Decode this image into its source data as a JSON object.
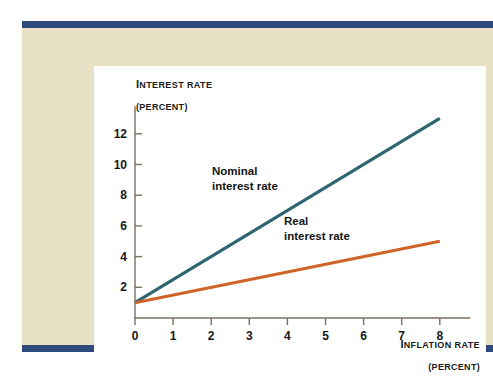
{
  "figure": {
    "background_color": "#ffffff",
    "panel_color": "#e9e1c5",
    "card_color": "#ffffff",
    "rule_color": "#2e4a7d"
  },
  "chart_data": {
    "type": "line",
    "title": "",
    "subtitle": "",
    "xlabel": "INFLATION RATE",
    "xunit": "(PERCENT)",
    "ylabel": "INTEREST RATE",
    "yunit": "(PERCENT)",
    "xlim": [
      0,
      8.8
    ],
    "ylim": [
      0,
      13.8
    ],
    "xticks": [
      0,
      1,
      2,
      3,
      4,
      5,
      6,
      7,
      8
    ],
    "xtick_labels": [
      "0",
      "1",
      "2",
      "3",
      "4",
      "5",
      "6",
      "7",
      "8"
    ],
    "yticks": [
      2,
      4,
      6,
      8,
      10,
      12
    ],
    "ytick_labels": [
      "2",
      "4",
      "6",
      "8",
      "10",
      "12"
    ],
    "grid": false,
    "legend_position": "inline-annotation",
    "series": [
      {
        "name": "Nominal interest rate",
        "label_line1": "Nominal",
        "label_line2": "interest rate",
        "color": "#2d6670",
        "x": [
          0,
          8
        ],
        "values": [
          1,
          13
        ],
        "slope": 1.5,
        "intercept": 1
      },
      {
        "name": "Real interest rate",
        "label_line1": "Real",
        "label_line2": "interest rate",
        "color": "#cf6428",
        "x": [
          0,
          8
        ],
        "values": [
          1,
          5
        ],
        "slope": 0.5,
        "intercept": 1
      }
    ],
    "axis_color": "#7a6f62"
  }
}
